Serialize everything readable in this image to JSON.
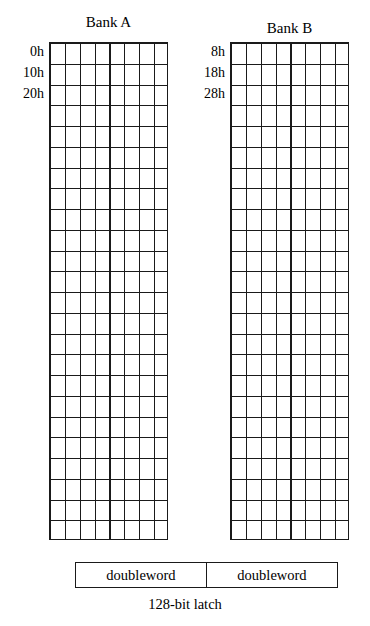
{
  "diagram": {
    "banks": [
      {
        "id": "bank-a",
        "title": "Bank A",
        "columns": 8,
        "rows": 24,
        "row_labels": [
          "0h",
          "10h",
          "20h"
        ]
      },
      {
        "id": "bank-b",
        "title": "Bank B",
        "columns": 8,
        "rows": 24,
        "row_labels": [
          "8h",
          "18h",
          "28h"
        ]
      }
    ],
    "latch": {
      "cells": [
        "doubleword",
        "doubleword"
      ],
      "caption": "128-bit latch"
    },
    "colors": {
      "line": "#1a1a1a",
      "background": "#ffffff",
      "text": "#000000"
    }
  }
}
